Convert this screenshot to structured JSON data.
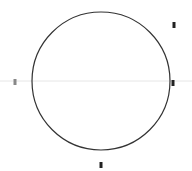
{
  "diagram": {
    "canvas": {
      "width": 192,
      "height": 171,
      "background": "#ffffff"
    },
    "circle": {
      "cx": 101,
      "cy": 81,
      "r": 69,
      "stroke": "#333333",
      "stroke_width": 1.2
    },
    "axis_line": {
      "x1": 0,
      "y1": 81,
      "x2": 192,
      "y2": 81,
      "stroke": "#e6e6e6"
    },
    "markers": [
      {
        "id": "top-right",
        "x": 174,
        "y": 25,
        "color": "#222222"
      },
      {
        "id": "right",
        "x": 173,
        "y": 83,
        "color": "#222222"
      },
      {
        "id": "bottom",
        "x": 101,
        "y": 165,
        "color": "#222222"
      },
      {
        "id": "left",
        "x": 15,
        "y": 82,
        "color": "#888888"
      }
    ]
  }
}
